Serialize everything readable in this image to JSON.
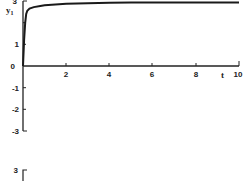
{
  "chart_data": {
    "type": "line",
    "title": "",
    "xlabel": "t",
    "ylabel": "y1",
    "ylabel_main": "y",
    "ylabel_sub": "1",
    "xlim": [
      0,
      10
    ],
    "ylim": [
      -3,
      3
    ],
    "x_ticks": [
      "2",
      "4",
      "6",
      "8",
      "10"
    ],
    "y_ticks": [
      "-3",
      "-2",
      "-1",
      "0",
      "1",
      "2",
      "3"
    ],
    "grid": false,
    "legend": null,
    "series": [
      {
        "name": "y1",
        "x": [
          0,
          0.05,
          0.1,
          0.15,
          0.2,
          0.3,
          0.5,
          0.8,
          1.0,
          1.5,
          2,
          3,
          4,
          5,
          6,
          7,
          8,
          9,
          10
        ],
        "y": [
          0,
          1.2,
          2.0,
          2.4,
          2.55,
          2.65,
          2.72,
          2.77,
          2.8,
          2.84,
          2.87,
          2.9,
          2.92,
          2.93,
          2.93,
          2.93,
          2.93,
          2.93,
          2.93
        ]
      }
    ],
    "second_panel_partial": {
      "y_tick_visible": "3"
    }
  }
}
